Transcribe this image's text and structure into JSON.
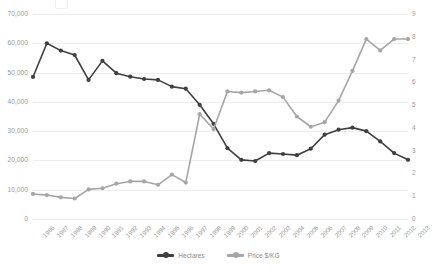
{
  "chart_data": {
    "type": "line",
    "title": "",
    "xlabel": "",
    "ylabel": "",
    "categories": [
      "1986",
      "1987",
      "1988",
      "1989",
      "1990",
      "1991",
      "1992",
      "1993",
      "1994",
      "1995",
      "1996",
      "1997",
      "1998",
      "1999",
      "2000",
      "2001",
      "2002",
      "2003",
      "2004",
      "2005",
      "2006",
      "2007",
      "2008",
      "2009",
      "2010",
      "2011",
      "2012",
      "2013"
    ],
    "grid": true,
    "legend_position": "bottom",
    "axes": {
      "left": {
        "label": "",
        "ticks": [
          "0",
          "10,000",
          "20,000",
          "30,000",
          "40,000",
          "50,000",
          "60,000",
          "70,000"
        ],
        "values": [
          0,
          10000,
          20000,
          30000,
          40000,
          50000,
          60000,
          70000
        ],
        "ylim": [
          0,
          70000
        ]
      },
      "right": {
        "label": "",
        "ticks": [
          "0",
          "1",
          "2",
          "3",
          "4",
          "5",
          "6",
          "7",
          "8",
          "9"
        ],
        "values": [
          0,
          1,
          2,
          3,
          4,
          5,
          6,
          7,
          8,
          9
        ],
        "ylim": [
          0,
          9
        ]
      }
    },
    "series": [
      {
        "name": "Hectares",
        "axis": "left",
        "color": "#3f3f3f",
        "values": [
          48500,
          60000,
          57500,
          56000,
          47500,
          54000,
          49800,
          48600,
          47800,
          47500,
          45200,
          44500,
          39000,
          32500,
          24200,
          20200,
          19800,
          22500,
          22200,
          21800,
          24000,
          28800,
          30500,
          31200,
          30000,
          26500,
          22500,
          20200
        ]
      },
      {
        "name": "Price $/KG",
        "axis": "right",
        "color": "#a6a6a6",
        "values": [
          1.1,
          1.05,
          0.95,
          0.9,
          1.3,
          1.35,
          1.55,
          1.65,
          1.65,
          1.5,
          1.95,
          1.6,
          4.6,
          3.95,
          5.6,
          5.55,
          5.6,
          5.65,
          5.35,
          4.5,
          4.05,
          4.25,
          5.2,
          6.5,
          7.9,
          7.4,
          7.9,
          7.9
        ]
      }
    ]
  },
  "legend": {
    "items": [
      {
        "label": "Hectares",
        "color": "#3f3f3f"
      },
      {
        "label": "Price $/KG",
        "color": "#a6a6a6"
      }
    ]
  }
}
